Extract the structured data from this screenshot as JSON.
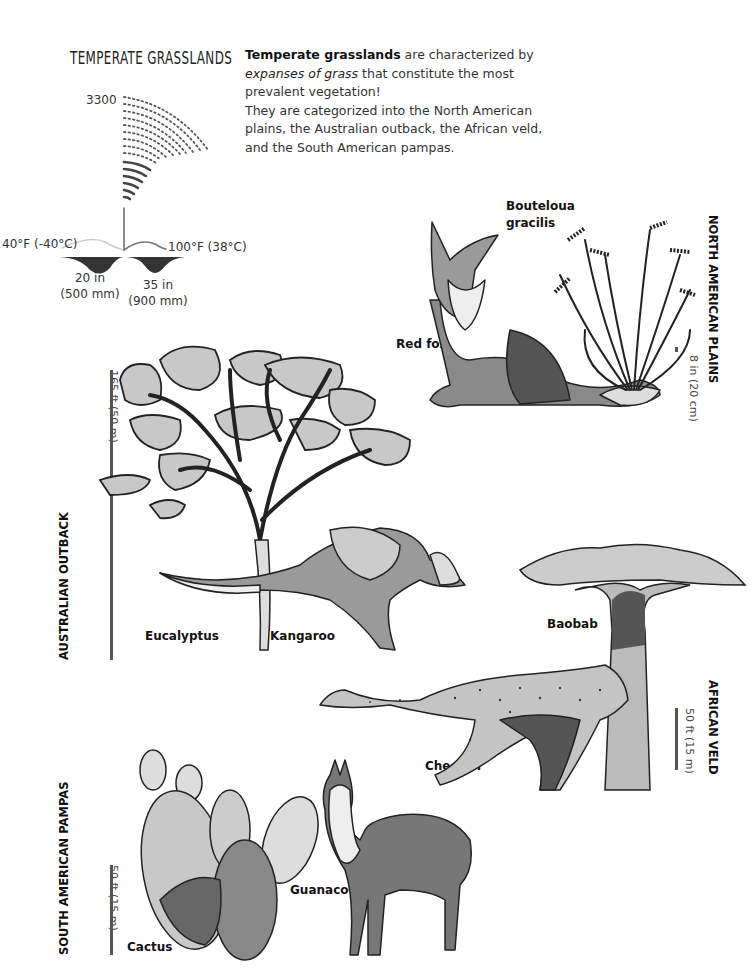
{
  "title": "TEMPERATE GRASSLANDS",
  "intro": {
    "bold_lead": "Temperate grasslands",
    "text1": " are characterized by ",
    "italic": "expanses of grass",
    "text2": " that constitute the most prevalent vegetation!",
    "text3": "They are categorized into the North American plains, the Australian outback, the African veld, and the South American pampas."
  },
  "climate": {
    "altitude_label": "3300",
    "temp_low": "40°F (-40°C)",
    "temp_high": "100°F (38°C)",
    "precip_low_in": "20 in",
    "precip_low_mm": "(500 mm)",
    "precip_high_in": "35 in",
    "precip_high_mm": "(900 mm)"
  },
  "regions": {
    "north_american": {
      "name": "NORTH AMERICAN PLAINS",
      "scale": "8 in (20 cm)",
      "species": [
        "Bouteloua gracilis",
        "Red fox"
      ],
      "labels": {
        "plant_line1": "Bouteloua",
        "plant_line2": "gracilis",
        "animal": "Red fox"
      }
    },
    "australian": {
      "name": "AUSTRALIAN OUTBACK",
      "scale": "165 ft (50 m)",
      "labels": {
        "plant": "Eucalyptus",
        "animal": "Kangaroo"
      }
    },
    "african": {
      "name": "AFRICAN VELD",
      "scale": "50 ft (15 m)",
      "labels": {
        "plant": "Baobab",
        "animal": "Cheetah"
      }
    },
    "south_american": {
      "name": "SOUTH AMERICAN PAMPAS",
      "scale": "50 ft (15 m)",
      "labels": {
        "plant": "Cactus",
        "animal": "Guanaco"
      }
    }
  },
  "colors": {
    "ink": "#222222",
    "light_gray": "#c8c8c8",
    "mid_gray": "#8a8a8a",
    "dark_gray": "#555555"
  }
}
